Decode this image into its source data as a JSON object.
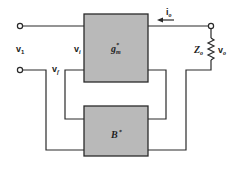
{
  "diagram": {
    "type": "feedback-amplifier-block-diagram",
    "blocks": [
      {
        "id": "forward",
        "label": "g",
        "label_sub": "m",
        "label_sup": "*"
      },
      {
        "id": "feedback",
        "label": "B",
        "label_sup": "*"
      }
    ],
    "labels": {
      "v1": {
        "main": "v",
        "sub": "1"
      },
      "vi": {
        "main": "v",
        "sub": "i"
      },
      "vf": {
        "main": "v",
        "sub": "f"
      },
      "io": {
        "main": "i",
        "sub": "o"
      },
      "zo": {
        "main": "Z",
        "sub": "o"
      },
      "vo": {
        "main": "v",
        "sub": "o"
      }
    },
    "colors": {
      "block_fill": "#b9b9b9",
      "wire": "#2a2a2a",
      "background": "#ffffff"
    }
  }
}
